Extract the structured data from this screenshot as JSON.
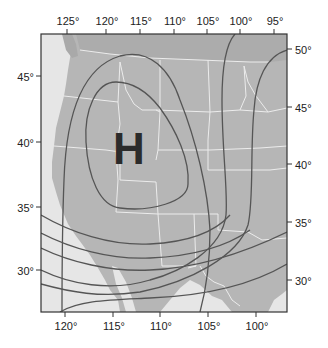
{
  "map": {
    "title": "",
    "high_pressure_label": "H",
    "colors": {
      "ocean": "#e6e6e6",
      "land": "#b5b5b5",
      "canada_land": "#adadad",
      "state_borders": "#ececec",
      "isobars": "#555555",
      "frame": "#333333",
      "high_label": "#2b2b2b"
    },
    "top_axis": {
      "labels": [
        "125°",
        "120°",
        "115°",
        "110°",
        "105°",
        "100°",
        "95°"
      ]
    },
    "bottom_axis": {
      "labels": [
        "120°",
        "115°",
        "110°",
        "105°",
        "100°"
      ]
    },
    "left_axis": {
      "labels": [
        "45°",
        "40°",
        "35°",
        "30°"
      ]
    },
    "right_axis": {
      "labels": [
        "50°",
        "45°",
        "40°",
        "35°",
        "30°"
      ]
    },
    "isobar_count": 7,
    "feature": "High pressure system centered over the western United States (Great Basin)"
  }
}
